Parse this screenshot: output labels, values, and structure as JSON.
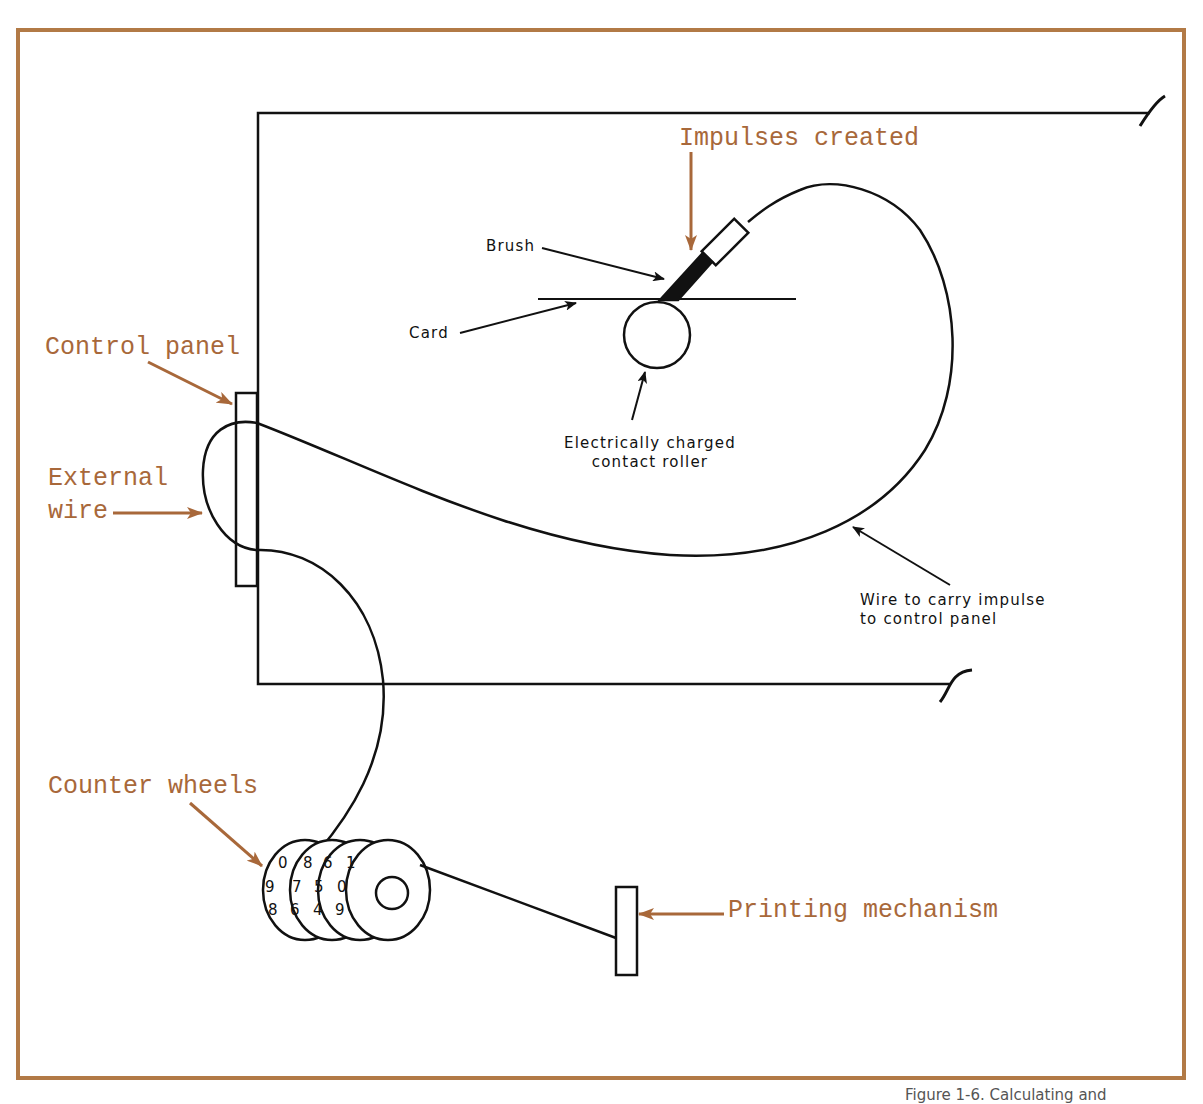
{
  "figure": {
    "frame_color": "#b27a46",
    "line_color": "#111111",
    "label_color": "#a8683a",
    "callouts_orange": {
      "impulses_created": "Impulses created",
      "control_panel": "Control panel",
      "external_wire_line1": "External",
      "external_wire_line2": "wire",
      "counter_wheels": "Counter wheels",
      "printing_mechanism": "Printing mechanism"
    },
    "callouts_black": {
      "brush": "Brush",
      "card": "Card",
      "roller_line1": "Electrically charged",
      "roller_line2": "contact roller",
      "wire_line1": "Wire to carry impulse",
      "wire_line2": "to control panel"
    },
    "counter_wheel_digits": [
      [
        "0",
        "9",
        "8",
        "7"
      ],
      [
        "8",
        "7",
        "6",
        "5"
      ],
      [
        "6",
        "5",
        "4",
        "3"
      ],
      [
        "1",
        "0",
        "9",
        "8"
      ]
    ],
    "caption_partial": "Figure 1-6. Calculating and"
  }
}
